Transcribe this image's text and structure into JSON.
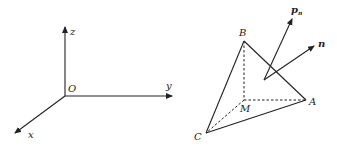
{
  "figure_left": {
    "title": "coordinate-axes",
    "labels": {
      "z": "z",
      "y": "y",
      "x": "x",
      "origin": "O"
    }
  },
  "figure_right": {
    "title": "tetrahedron-with-normal",
    "labels": {
      "A": "A",
      "B": "B",
      "C": "C",
      "M": "M",
      "n": "n",
      "p": "p",
      "p_sub": "n"
    }
  },
  "colors": {
    "stroke": "#222222",
    "background": "#ffffff"
  }
}
